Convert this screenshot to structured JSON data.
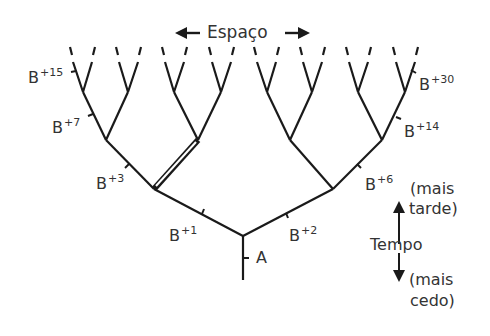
{
  "space_axis": {
    "label": "Espaço",
    "left_arrow_icon": "arrow-left-icon",
    "right_arrow_icon": "arrow-right-icon"
  },
  "time_axis": {
    "label": "Tempo",
    "later_line1": "(mais",
    "later_line2": "tarde)",
    "earlier_line1": "(mais",
    "earlier_line2": "cedo)",
    "up_arrow_icon": "arrow-up-icon",
    "down_arrow_icon": "arrow-down-icon"
  },
  "branch_labels": {
    "A": {
      "base": "A",
      "sup": ""
    },
    "B1": {
      "base": "B",
      "sup": "+1"
    },
    "B2": {
      "base": "B",
      "sup": "+2"
    },
    "B3": {
      "base": "B",
      "sup": "+3"
    },
    "B6": {
      "base": "B",
      "sup": "+6"
    },
    "B7": {
      "base": "B",
      "sup": "+7"
    },
    "B14": {
      "base": "B",
      "sup": "+14"
    },
    "B15": {
      "base": "B",
      "sup": "+15"
    },
    "B30": {
      "base": "B",
      "sup": "+30"
    }
  },
  "tree": {
    "root": "A",
    "levels": 4,
    "leaf_count": 16,
    "highlighted_branch": "double line from B+3 node to its right child"
  }
}
